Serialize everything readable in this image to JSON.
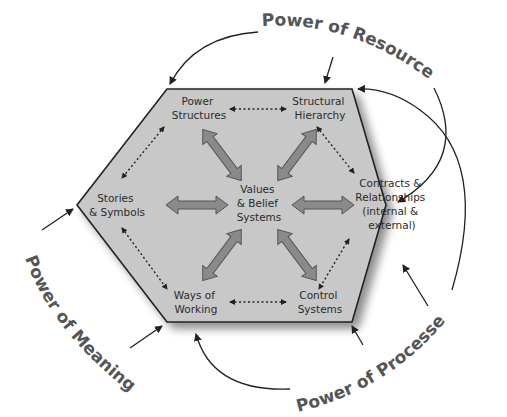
{
  "colors": {
    "hexagon_fill": "#c8c8c8",
    "hexagon_stroke": "#222222",
    "big_arrow_fill": "#8a8a8a",
    "big_arrow_stroke": "#555555",
    "power_label": "#555555",
    "node_text": "#2b2b2b"
  },
  "center": {
    "lines": [
      "Values",
      "& Belief",
      "Systems"
    ]
  },
  "nodes": {
    "power_structures": {
      "lines": [
        "Power",
        "Structures"
      ]
    },
    "structural_hierarchy": {
      "lines": [
        "Structural",
        "Hierarchy"
      ]
    },
    "contracts_relationships": {
      "lines": [
        "Contracts &",
        "Relationships",
        "(internal &",
        "external)"
      ]
    },
    "control_systems": {
      "lines": [
        "Control",
        "Systems"
      ]
    },
    "ways_of_working": {
      "lines": [
        "Ways of",
        "Working"
      ]
    },
    "stories_symbols": {
      "lines": [
        "Stories",
        "& Symbols"
      ]
    }
  },
  "powers": {
    "resources": "Power of Resources",
    "meaning": "Power of Meaning",
    "processes": "Power of Processes"
  }
}
